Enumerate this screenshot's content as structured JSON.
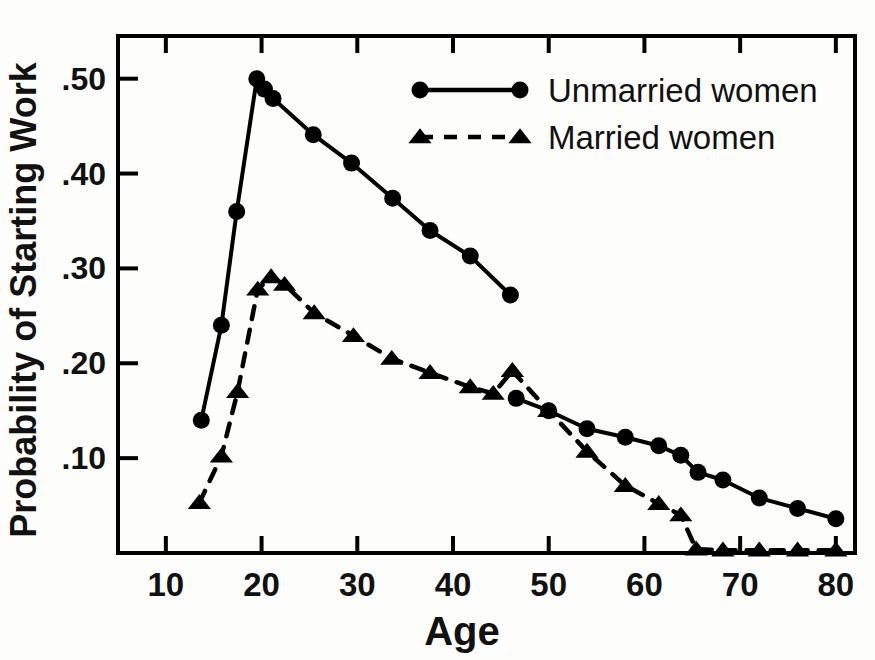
{
  "chart_data": {
    "type": "line",
    "title": "",
    "xlabel": "Age",
    "ylabel": "Probability of Starting Work",
    "xlim": [
      5,
      82
    ],
    "ylim": [
      0.0,
      0.545
    ],
    "grid": false,
    "legend_position": "top-right",
    "xticks": [
      10,
      20,
      30,
      40,
      50,
      60,
      70,
      80
    ],
    "xtick_labels": [
      "10",
      "20",
      "30",
      "40",
      "50",
      "60",
      "70",
      "80"
    ],
    "yticks": [
      0.1,
      0.2,
      0.3,
      0.4,
      0.5
    ],
    "ytick_labels": [
      ".10",
      ".20",
      ".30",
      ".40",
      ".50"
    ],
    "series": [
      {
        "name": "Unmarried women",
        "marker": "circle",
        "linestyle": "solid",
        "color": "#000000",
        "segments": [
          {
            "x": [
              13.7,
              15.8,
              17.4,
              19.5,
              20.3,
              21.2,
              25.4,
              29.4,
              33.7,
              37.6,
              41.8,
              46.0
            ],
            "y": [
              0.14,
              0.24,
              0.36,
              0.5,
              0.489,
              0.479,
              0.441,
              0.411,
              0.374,
              0.34,
              0.313,
              0.272
            ]
          },
          {
            "x": [
              46.6,
              50.0,
              54.0,
              58.0,
              61.5,
              63.8,
              65.6,
              68.2,
              72.0,
              76.0,
              80.0
            ],
            "y": [
              0.163,
              0.15,
              0.131,
              0.122,
              0.113,
              0.103,
              0.085,
              0.077,
              0.058,
              0.047,
              0.036
            ]
          }
        ]
      },
      {
        "name": "Married women",
        "marker": "triangle",
        "linestyle": "dashed",
        "color": "#000000",
        "segments": [
          {
            "x": [
              13.5,
              15.8,
              17.5,
              19.6,
              21.0,
              22.4,
              25.5,
              29.6,
              33.6,
              37.6,
              41.8,
              44.2,
              46.2
            ],
            "y": [
              0.053,
              0.102,
              0.17,
              0.278,
              0.291,
              0.283,
              0.253,
              0.229,
              0.205,
              0.19,
              0.175,
              0.168,
              0.192
            ]
          },
          {
            "x": [
              46.2,
              50.0,
              54.0,
              58.0,
              61.5,
              63.8,
              65.4,
              68.2,
              72.0,
              76.0,
              80.0
            ],
            "y": [
              0.192,
              0.15,
              0.107,
              0.071,
              0.052,
              0.04,
              0.004,
              0.003,
              0.003,
              0.003,
              0.003
            ]
          }
        ]
      }
    ],
    "legend": [
      {
        "label": "Unmarried women",
        "marker": "circle",
        "linestyle": "solid"
      },
      {
        "label": "Married women",
        "marker": "triangle",
        "linestyle": "dashed"
      }
    ]
  }
}
